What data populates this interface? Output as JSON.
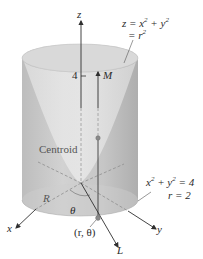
{
  "figure": {
    "type": "3D solid diagram",
    "colors": {
      "cylinder_fill": "#c9c9c9",
      "cylinder_shade": "#b7b7b7",
      "top_ellipse": "#d8d8d8",
      "axis": "#3a3a3a",
      "dashed": "#9a9a9a",
      "point": "#8a8a8a"
    }
  },
  "labels": {
    "z_axis": "z",
    "x_axis": "x",
    "y_axis": "y",
    "tick_4": "4",
    "moment_arrow": "M",
    "line_L": "L",
    "centroid": "Centroid",
    "region": "R",
    "angle": "θ",
    "point": "(r, θ)",
    "paraboloid_eq_line1_a": "z = x",
    "paraboloid_eq_line1_b": " + y",
    "paraboloid_eq_line2": "= r",
    "circle_eq_line1_a": "x",
    "circle_eq_line1_b": " + y",
    "circle_eq_line1_c": " = 4",
    "circle_eq_line2": "r = 2",
    "exp2": "2"
  }
}
